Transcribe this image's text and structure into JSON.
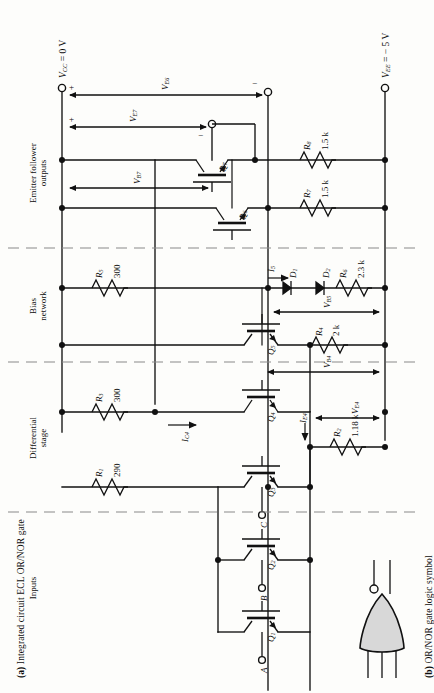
{
  "figure": {
    "caption_a": "Integrated circuit ECL OR/NOR gate",
    "caption_a_tag": "(a)",
    "caption_b": "OR/NOR gate logic symbol",
    "caption_b_tag": "(b)"
  },
  "rails": {
    "vcc": "V_CC = 0 V",
    "vcc_name": "V",
    "vcc_sub": "CC",
    "vcc_val": " = 0 V",
    "vee_name": "V",
    "vee_sub": "EE",
    "vee_val": " = − 5 V"
  },
  "sections": [
    {
      "id": "emitter-follower",
      "label": "Emitter follower\noutputs",
      "line1": "Emitter follower",
      "line2": "outputs"
    },
    {
      "id": "bias-network",
      "label": "Bias network",
      "line1": "Bias",
      "line2": "network"
    },
    {
      "id": "differential-stage",
      "label": "Differential stage",
      "line1": "Differential",
      "line2": "stage"
    },
    {
      "id": "inputs",
      "label": "Inputs",
      "line1": "Inputs",
      "line2": ""
    }
  ],
  "resistors": [
    {
      "id": "R1",
      "name": "R",
      "sub": "1",
      "value": "290"
    },
    {
      "id": "R2",
      "name": "R",
      "sub": "2",
      "value": "1.18 k"
    },
    {
      "id": "R3",
      "name": "R",
      "sub": "3",
      "value": "300"
    },
    {
      "id": "R4",
      "name": "R",
      "sub": "4",
      "value": "2 k"
    },
    {
      "id": "R5",
      "name": "R",
      "sub": "5",
      "value": "300"
    },
    {
      "id": "R6",
      "name": "R",
      "sub": "6",
      "value": "2.3 k"
    },
    {
      "id": "R7",
      "name": "R",
      "sub": "7",
      "value": "1.5 k"
    },
    {
      "id": "R8",
      "name": "R",
      "sub": "8",
      "value": "1.5 k"
    }
  ],
  "transistors": [
    {
      "id": "Q1",
      "name": "Q",
      "sub": "1"
    },
    {
      "id": "Q2",
      "name": "Q",
      "sub": "2"
    },
    {
      "id": "Q3",
      "name": "Q",
      "sub": "3"
    },
    {
      "id": "Q4",
      "name": "Q",
      "sub": "4"
    },
    {
      "id": "Q5",
      "name": "Q",
      "sub": "5"
    },
    {
      "id": "Q6",
      "name": "Q",
      "sub": "6"
    },
    {
      "id": "Q7",
      "name": "Q",
      "sub": "7"
    }
  ],
  "diodes": [
    {
      "id": "D1",
      "name": "D",
      "sub": "1"
    },
    {
      "id": "D2",
      "name": "D",
      "sub": "2"
    }
  ],
  "currents": [
    {
      "id": "I5",
      "name": "I",
      "sub": "5"
    },
    {
      "id": "IC4",
      "name": "I",
      "sub": "C4"
    },
    {
      "id": "IE4",
      "name": "I",
      "sub": "E4"
    }
  ],
  "voltages": [
    {
      "id": "VE6",
      "name": "V",
      "sub": "E6"
    },
    {
      "id": "VE7",
      "name": "V",
      "sub": "E7"
    },
    {
      "id": "VB7",
      "name": "V",
      "sub": "B7"
    },
    {
      "id": "VB5",
      "name": "V",
      "sub": "B5"
    },
    {
      "id": "VB4",
      "name": "V",
      "sub": "B4"
    },
    {
      "id": "VE4",
      "name": "V",
      "sub": "E4"
    }
  ],
  "polarity": {
    "plus": "+",
    "minus": "−"
  },
  "inputs": [
    {
      "id": "A",
      "label": "A"
    },
    {
      "id": "B",
      "label": "B"
    },
    {
      "id": "C",
      "label": "C"
    }
  ],
  "colors": {
    "ink": "#111111",
    "paper": "#fdfdfb",
    "dashed": "#8a8a8a",
    "gate_fill": "#d8d8d8"
  }
}
